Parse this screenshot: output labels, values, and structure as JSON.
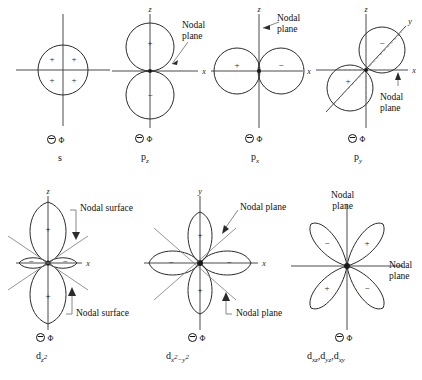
{
  "figure": {
    "line_color": "#2b2b2b",
    "axis_color": "#4a4a4a",
    "background": "#ffffff",
    "legend_symbol": "circle-minus-phi",
    "legend_phi": "Φ"
  },
  "panels": [
    {
      "id": "s",
      "label_prefix": "s",
      "label_sub": "",
      "axes": [],
      "signs": [
        "+",
        "+",
        "+",
        "+"
      ],
      "annotations": [],
      "legend": "Φ"
    },
    {
      "id": "pz",
      "label_prefix": "p",
      "label_sub": "z",
      "axes": [
        "z",
        "x"
      ],
      "signs": [
        "+",
        "−"
      ],
      "annotations": [
        "Nodal\nplane"
      ],
      "legend": "Φ"
    },
    {
      "id": "px",
      "label_prefix": "p",
      "label_sub": "x",
      "axes": [
        "z",
        "x"
      ],
      "signs": [
        "+",
        "−"
      ],
      "annotations": [
        "Nodal\nplane"
      ],
      "legend": "Φ"
    },
    {
      "id": "py",
      "label_prefix": "p",
      "label_sub": "y",
      "axes": [
        "z",
        "x",
        "y"
      ],
      "signs": [
        "−",
        "+"
      ],
      "annotations": [
        "Nodal\nplane"
      ],
      "legend": "Φ"
    },
    {
      "id": "dz2",
      "label_prefix": "d",
      "label_sub": "z",
      "label_sup": "2",
      "axes": [
        "z",
        "x"
      ],
      "signs": [
        "+",
        "+",
        "−",
        "−"
      ],
      "annotations": [
        "Nodal surface",
        "Nodal surface"
      ],
      "legend": "Φ"
    },
    {
      "id": "dx2y2",
      "label_prefix": "d",
      "label_sub_a": "x",
      "label_sup_a": "2",
      "label_minus": "−",
      "label_sub_b": "y",
      "label_sup_b": "2",
      "axes": [
        "y",
        "x"
      ],
      "signs": [
        "+",
        "+",
        "−",
        "−"
      ],
      "annotations": [
        "Nodal plane",
        "Nodal plane"
      ],
      "legend": "Φ"
    },
    {
      "id": "dxz",
      "label_text": "d",
      "label_subs": [
        "xz",
        "yz",
        "xy"
      ],
      "axes": [],
      "signs": [
        "−",
        "+",
        "+",
        "−"
      ],
      "annotations": [
        "Nodal\nplane",
        "Nodal\nplane"
      ],
      "legend": "Φ"
    }
  ],
  "labels": {
    "s": "s",
    "pz_main": "p",
    "pz_sub": "z",
    "px_main": "p",
    "px_sub": "x",
    "py_main": "p",
    "py_sub": "y",
    "dz2_main": "d",
    "dz2_sub": "z",
    "dz2_sup": "2",
    "dx2y2_main": "d",
    "dx2y2_sub_a": "x",
    "dx2y2_sup_a": "2",
    "dx2y2_dash": "−",
    "dx2y2_sub_b": "y",
    "dx2y2_sup_b": "2",
    "dxyz_main": "d",
    "dxyz_sub1": "xz",
    "dxyz_comma1": ",d",
    "dxyz_sub2": "yz",
    "dxyz_comma2": ",d",
    "dxyz_sub3": "xy"
  },
  "annotations": {
    "nodal_plane": "Nodal\nplane",
    "nodal_plane_inline": "Nodal plane",
    "nodal_surface": "Nodal surface"
  },
  "axis_labels": {
    "z": "z",
    "x": "x",
    "y": "y"
  },
  "signs": {
    "plus": "+",
    "minus": "−"
  }
}
